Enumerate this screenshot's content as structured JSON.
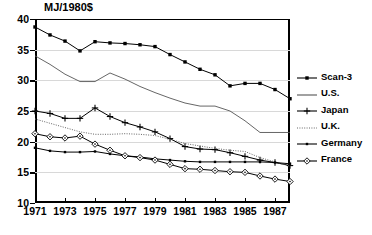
{
  "chart_data": {
    "type": "line",
    "title": "",
    "ylabel": "MJ/1980$",
    "xlabel": "",
    "ylim": [
      10,
      40
    ],
    "xlim": [
      1971,
      1988
    ],
    "grid": true,
    "legend_position": "right",
    "yticks": [
      40,
      35,
      30,
      25,
      20,
      15,
      10
    ],
    "xticks": [
      1971,
      1973,
      1975,
      1977,
      1979,
      1981,
      1983,
      1985,
      1987
    ],
    "x": [
      1971,
      1972,
      1973,
      1974,
      1975,
      1976,
      1977,
      1978,
      1979,
      1980,
      1981,
      1982,
      1983,
      1984,
      1985,
      1986,
      1987,
      1988
    ],
    "series": [
      {
        "name": "Scan-3",
        "marker": "filled-square",
        "style": "solid",
        "color": "#000000",
        "values": [
          38.7,
          37.4,
          36.4,
          34.8,
          36.3,
          36.1,
          36.0,
          35.8,
          35.5,
          34.2,
          33.0,
          31.8,
          30.9,
          29.1,
          29.5,
          29.5,
          28.5,
          27.0
        ]
      },
      {
        "name": "U.S.",
        "marker": "none",
        "style": "solid",
        "color": "#555555",
        "values": [
          34.0,
          32.6,
          31.0,
          29.8,
          29.8,
          31.2,
          30.2,
          29.0,
          28.0,
          27.1,
          26.3,
          25.8,
          25.8,
          25.0,
          23.4,
          21.5,
          21.5,
          21.5
        ]
      },
      {
        "name": "Japan",
        "marker": "plus",
        "style": "solid",
        "color": "#000000",
        "values": [
          25.0,
          24.6,
          23.8,
          23.8,
          25.5,
          24.1,
          23.1,
          22.4,
          21.6,
          20.5,
          19.2,
          18.8,
          18.7,
          18.2,
          17.6,
          17.0,
          16.6,
          16.1
        ]
      },
      {
        "name": "U.K.",
        "marker": "none",
        "style": "dotted",
        "color": "#666666",
        "values": [
          23.7,
          23.0,
          22.3,
          21.6,
          21.2,
          21.2,
          21.3,
          21.2,
          21.0,
          20.4,
          19.7,
          19.3,
          18.9,
          18.6,
          18.4,
          17.4,
          16.7,
          16.0
        ]
      },
      {
        "name": "Germany",
        "marker": "small-square",
        "style": "solid",
        "color": "#000000",
        "values": [
          19.0,
          18.5,
          18.3,
          18.3,
          18.4,
          18.0,
          17.7,
          17.5,
          17.2,
          17.0,
          16.8,
          16.7,
          16.7,
          16.7,
          16.7,
          16.7,
          16.6,
          16.4
        ]
      },
      {
        "name": "France",
        "marker": "diamond",
        "style": "solid",
        "color": "#000000",
        "values": [
          21.3,
          20.8,
          20.6,
          20.9,
          19.6,
          18.6,
          17.7,
          17.4,
          17.0,
          16.3,
          15.6,
          15.5,
          15.3,
          15.1,
          15.0,
          14.4,
          13.9,
          13.5
        ]
      }
    ]
  },
  "legend": {
    "items": [
      {
        "label": "Scan-3"
      },
      {
        "label": "U.S."
      },
      {
        "label": "Japan"
      },
      {
        "label": "U.K."
      },
      {
        "label": "Germany"
      },
      {
        "label": "France"
      }
    ]
  }
}
